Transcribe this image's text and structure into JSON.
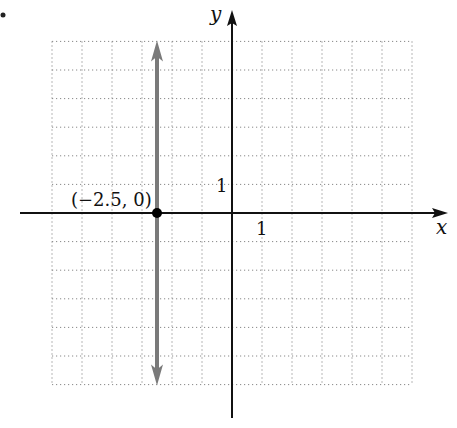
{
  "chart_data": {
    "type": "line",
    "title": "",
    "xlabel": "x",
    "ylabel": "y",
    "xlim": [
      -6,
      6
    ],
    "ylim": [
      -6,
      6
    ],
    "grid": true,
    "tick_labels": {
      "x": "1",
      "y": "1"
    },
    "series": [
      {
        "name": "vertical line x = -2.5",
        "x": [
          -2.5,
          -2.5
        ],
        "y": [
          -6,
          6
        ],
        "color": "#7a7a7a",
        "arrows": "both"
      }
    ],
    "points": [
      {
        "x": -2.5,
        "y": 0,
        "label": "(−2.5, 0)",
        "color": "#000000"
      }
    ]
  },
  "labels": {
    "x_axis": "x",
    "y_axis": "y",
    "x_tick": "1",
    "y_tick": "1",
    "point": "(−2.5, 0)"
  }
}
